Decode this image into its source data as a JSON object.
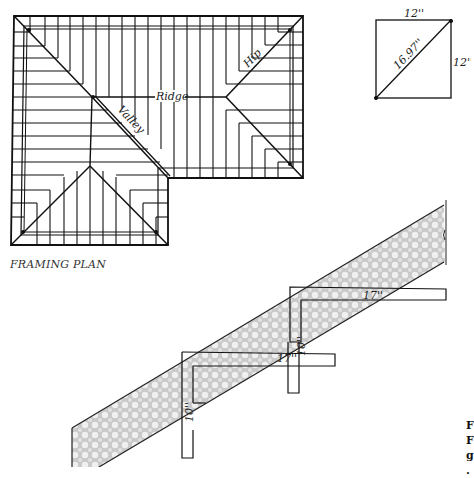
{
  "framing_plan": {
    "title": "FRAMING PLAN",
    "labels": {
      "ridge": "Ridge",
      "valley": "Valley",
      "hip": "Hip"
    }
  },
  "square_diagram": {
    "top_label": "12''",
    "side_label": "12''",
    "diagonal_label": "16.97''"
  },
  "stringer_diagram": {
    "upper_square": {
      "run_label": "17''",
      "rise_label": "10''"
    },
    "lower_square": {
      "run_label": "17''",
      "rise_label": "10''"
    }
  },
  "caption_fragment": [
    "F",
    "F",
    "g",
    "."
  ]
}
